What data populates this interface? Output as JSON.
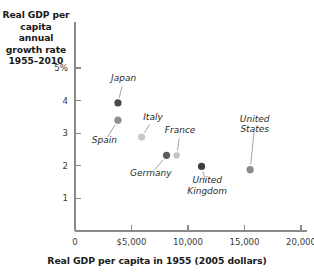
{
  "chart_data": {
    "type": "scatter",
    "title": "",
    "ylabel": "Real GDP per capita annual growth rate 1955–2010",
    "xlabel": "Real GDP per capita in 1955 (2005 dollars)",
    "xlim": [
      0,
      20000
    ],
    "ylim": [
      0,
      5
    ],
    "grid": false,
    "legend": "none",
    "x_ticks": [
      {
        "value": 0,
        "label": "0"
      },
      {
        "value": 5000,
        "label": "$5,000"
      },
      {
        "value": 10000,
        "label": "10,000"
      },
      {
        "value": 15000,
        "label": "15,000"
      },
      {
        "value": 20000,
        "label": "20,000"
      }
    ],
    "y_ticks": [
      {
        "value": 1,
        "label": "1"
      },
      {
        "value": 2,
        "label": "2"
      },
      {
        "value": 3,
        "label": "3"
      },
      {
        "value": 4,
        "label": "4"
      },
      {
        "value": 5,
        "label": "5%"
      }
    ],
    "points": [
      {
        "name": "Japan",
        "x": 3800,
        "y": 3.93,
        "color": "#4a4a4a",
        "radius": 3.6,
        "label_x": 4300,
        "label_y": 4.62,
        "label_align": "center"
      },
      {
        "name": "Spain",
        "x": 3800,
        "y": 3.4,
        "color": "#8f8f8f",
        "radius": 3.6,
        "label_x": 2600,
        "label_y": 2.72,
        "label_align": "center"
      },
      {
        "name": "Italy",
        "x": 5900,
        "y": 2.88,
        "color": "#c8c8c8",
        "radius": 3.6,
        "label_x": 6900,
        "label_y": 3.42,
        "label_align": "center"
      },
      {
        "name": "Germany",
        "x": 8100,
        "y": 2.32,
        "color": "#5a5a5a",
        "radius": 3.6,
        "label_x": 6700,
        "label_y": 1.72,
        "label_align": "center"
      },
      {
        "name": "France",
        "x": 9000,
        "y": 2.32,
        "color": "#c2c2c2",
        "radius": 3.2,
        "label_x": 9300,
        "label_y": 3.02,
        "label_align": "center"
      },
      {
        "name": "United Kingdom",
        "x": 11200,
        "y": 1.98,
        "color": "#3d3d3d",
        "radius": 3.6,
        "label_x": 11700,
        "label_y": 1.32,
        "label_align": "center"
      },
      {
        "name": "United States",
        "x": 15500,
        "y": 1.88,
        "color": "#8a8a8a",
        "radius": 3.6,
        "label_x": 15900,
        "label_y": 3.22,
        "label_align": "center"
      }
    ]
  },
  "axis": {
    "y_title": "Real GDP per\ncapita annual\ngrowth rate\n1955–2010",
    "y_title_line1": "Real GDP per",
    "y_title_line2": "capita annual",
    "y_title_line3": "growth rate",
    "y_title_line4": "1955–2010",
    "x_title": "Real GDP per capita in 1955 (2005 dollars)"
  },
  "colors": {
    "axis": "#8a8a8a",
    "text": "#1a1a1a",
    "leader": "#9a9a9a",
    "background": "#ffffff"
  }
}
